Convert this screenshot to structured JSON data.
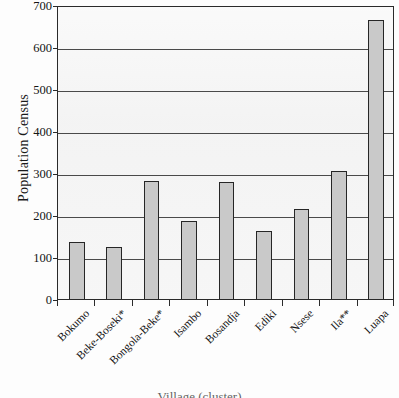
{
  "chart_data": {
    "type": "bar",
    "title": "",
    "xlabel": "Village (cluster)",
    "ylabel": "Population Census",
    "categories": [
      "Bokumo",
      "Beke-Boseki*",
      "Bongola-Beke*",
      "Isambo",
      "Bosandja",
      "Ediki",
      "Nsese",
      "Ila**",
      "Luapa"
    ],
    "values": [
      135,
      125,
      280,
      185,
      278,
      162,
      215,
      305,
      665
    ],
    "ylim": [
      0,
      700
    ],
    "ytick_values": [
      0,
      100,
      200,
      300,
      400,
      500,
      600,
      700
    ],
    "ytick_labels": [
      "0",
      "100",
      "200",
      "300",
      "400",
      "500",
      "600",
      "700"
    ],
    "grid": true,
    "gridlines_at": [
      100,
      200,
      300,
      400,
      500,
      600
    ],
    "legend": null,
    "legend_position": "none",
    "bar_fill_color": "#c9c9c9",
    "bar_border_color": "#262626",
    "plot_background_color": "#f3f3f3",
    "axis_color": "#2a2a2a"
  }
}
